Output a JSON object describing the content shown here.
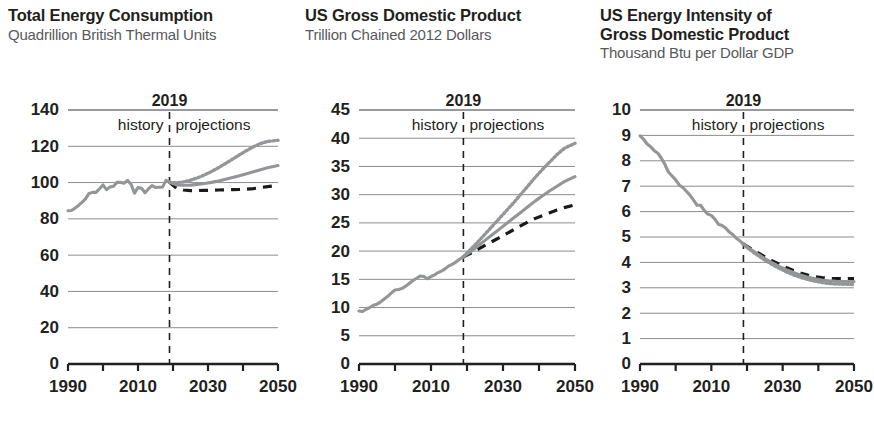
{
  "figure": {
    "background": "#ffffff",
    "colors": {
      "reference_line": "#939598",
      "high_line": "#939598",
      "low_line": "#1a1a1a",
      "text": "#231f20",
      "subtitle": "#58595b",
      "gridline": "#8c8c8c"
    }
  },
  "panels": [
    {
      "id": "total-energy-consumption",
      "title": "Total Energy Consumption",
      "subtitle": "Quadrillion British Thermal Units"
    },
    {
      "id": "us-gross-domestic-product",
      "title": "US Gross Domestic Product",
      "subtitle": "Trillion Chained 2012 Dollars"
    },
    {
      "id": "us-energy-intensity-of-gdp",
      "title": "US Energy Intensity of\nGross Domestic Product",
      "subtitle": "Thousand Btu per Dollar GDP"
    }
  ],
  "marker": {
    "year": "2019",
    "history_label": "history",
    "projections_label": "projections",
    "value": 2019
  },
  "chart_data": [
    {
      "type": "line",
      "title": "Total Energy Consumption",
      "subtitle": "Quadrillion British Thermal Units",
      "xlabel": "",
      "ylabel": "Quadrillion British Thermal Units",
      "xlim": [
        1990,
        2050
      ],
      "ylim": [
        0,
        140
      ],
      "yticks": [
        0,
        20,
        40,
        60,
        80,
        100,
        120,
        140
      ],
      "xticks": [
        1990,
        2000,
        2010,
        2020,
        2030,
        2040,
        2050
      ],
      "xtick_labels": [
        "1990",
        "",
        "2010",
        "",
        "2030",
        "",
        "2050"
      ],
      "grid": true,
      "legend": "none",
      "divider_year": 2019,
      "series": [
        {
          "name": "history",
          "style": "solid-gray",
          "x": [
            1990,
            1991,
            1992,
            1993,
            1994,
            1995,
            1996,
            1997,
            1998,
            1999,
            2000,
            2001,
            2002,
            2003,
            2004,
            2005,
            2006,
            2007,
            2008,
            2009,
            2010,
            2011,
            2012,
            2013,
            2014,
            2015,
            2016,
            2017,
            2018,
            2019
          ],
          "values": [
            84.5,
            84.6,
            85.9,
            87.4,
            89.1,
            91.0,
            94.0,
            94.6,
            94.6,
            96.6,
            98.7,
            96.1,
            97.6,
            98.0,
            100.1,
            100.2,
            99.6,
            101.2,
            99.1,
            94.2,
            97.3,
            96.9,
            94.4,
            96.5,
            98.3,
            97.3,
            97.4,
            97.5,
            101.2,
            100.2
          ]
        },
        {
          "name": "Reference case",
          "style": "solid-gray",
          "x": [
            2019,
            2021,
            2023,
            2025,
            2027,
            2029,
            2031,
            2033,
            2035,
            2037,
            2039,
            2041,
            2043,
            2045,
            2047,
            2050
          ],
          "values": [
            100.2,
            98.7,
            98.5,
            98.6,
            99.0,
            99.5,
            100.1,
            100.9,
            101.8,
            102.8,
            103.8,
            104.9,
            106.0,
            107.1,
            108.2,
            109.4
          ]
        },
        {
          "name": "High economic growth",
          "style": "dotted-gray",
          "x": [
            2019,
            2021,
            2023,
            2025,
            2027,
            2029,
            2031,
            2033,
            2035,
            2037,
            2039,
            2041,
            2043,
            2045,
            2047,
            2050
          ],
          "values": [
            100.2,
            99.8,
            100.4,
            101.3,
            102.6,
            104.2,
            106.1,
            108.2,
            110.5,
            112.9,
            115.3,
            117.6,
            119.7,
            121.5,
            122.7,
            123.3
          ]
        },
        {
          "name": "Low economic growth",
          "style": "dashed-black",
          "x": [
            2019,
            2021,
            2023,
            2025,
            2027,
            2029,
            2031,
            2033,
            2035,
            2037,
            2039,
            2041,
            2043,
            2045,
            2047,
            2050
          ],
          "values": [
            100.2,
            96.9,
            95.9,
            95.6,
            95.6,
            95.7,
            95.8,
            95.9,
            96.0,
            96.1,
            96.2,
            96.4,
            96.7,
            97.2,
            97.8,
            98.4
          ]
        }
      ]
    },
    {
      "type": "line",
      "title": "US Gross Domestic Product",
      "subtitle": "Trillion Chained 2012 Dollars",
      "xlabel": "",
      "ylabel": "Trillion Chained 2012 Dollars",
      "xlim": [
        1990,
        2050
      ],
      "ylim": [
        0,
        45
      ],
      "yticks": [
        0,
        5,
        10,
        15,
        20,
        25,
        30,
        35,
        40,
        45
      ],
      "xticks": [
        1990,
        2000,
        2010,
        2020,
        2030,
        2040,
        2050
      ],
      "xtick_labels": [
        "1990",
        "",
        "2010",
        "",
        "2030",
        "",
        "2050"
      ],
      "grid": true,
      "legend": "none",
      "divider_year": 2019,
      "series": [
        {
          "name": "history",
          "style": "solid-gray",
          "x": [
            1990,
            1991,
            1992,
            1993,
            1994,
            1995,
            1996,
            1997,
            1998,
            1999,
            2000,
            2001,
            2002,
            2003,
            2004,
            2005,
            2006,
            2007,
            2008,
            2009,
            2010,
            2011,
            2012,
            2013,
            2014,
            2015,
            2016,
            2017,
            2018,
            2019
          ],
          "values": [
            9.4,
            9.3,
            9.7,
            10.0,
            10.4,
            10.6,
            11.0,
            11.5,
            12.0,
            12.6,
            13.1,
            13.2,
            13.4,
            13.8,
            14.3,
            14.8,
            15.2,
            15.6,
            15.5,
            15.1,
            15.5,
            15.8,
            16.2,
            16.5,
            16.9,
            17.4,
            17.7,
            18.1,
            18.6,
            19.0
          ]
        },
        {
          "name": "Reference case",
          "style": "solid-gray",
          "x": [
            2019,
            2021,
            2023,
            2025,
            2027,
            2029,
            2031,
            2033,
            2035,
            2037,
            2039,
            2041,
            2043,
            2045,
            2047,
            2050
          ],
          "values": [
            19.0,
            19.9,
            20.9,
            21.9,
            22.9,
            23.9,
            24.9,
            25.9,
            26.9,
            27.9,
            28.9,
            29.8,
            30.7,
            31.5,
            32.3,
            33.2
          ]
        },
        {
          "name": "High economic growth",
          "style": "dotted-gray",
          "x": [
            2019,
            2021,
            2023,
            2025,
            2027,
            2029,
            2031,
            2033,
            2035,
            2037,
            2039,
            2041,
            2043,
            2045,
            2047,
            2050
          ],
          "values": [
            19.0,
            20.3,
            21.6,
            23.0,
            24.4,
            25.8,
            27.2,
            28.6,
            30.1,
            31.6,
            33.1,
            34.5,
            35.8,
            37.1,
            38.2,
            39.1
          ]
        },
        {
          "name": "Low economic growth",
          "style": "dashed-black",
          "x": [
            2019,
            2021,
            2023,
            2025,
            2027,
            2029,
            2031,
            2033,
            2035,
            2037,
            2039,
            2041,
            2043,
            2045,
            2047,
            2050
          ],
          "values": [
            19.0,
            19.6,
            20.3,
            21.0,
            21.7,
            22.4,
            23.1,
            23.8,
            24.5,
            25.2,
            25.8,
            26.3,
            26.8,
            27.3,
            27.7,
            28.2
          ]
        }
      ]
    },
    {
      "type": "line",
      "title": "US Energy Intensity of Gross Domestic Product",
      "subtitle": "Thousand Btu per Dollar GDP",
      "xlabel": "",
      "ylabel": "Thousand Btu per Dollar GDP",
      "xlim": [
        1990,
        2050
      ],
      "ylim": [
        0,
        10
      ],
      "yticks": [
        0,
        1,
        2,
        3,
        4,
        5,
        6,
        7,
        8,
        9,
        10
      ],
      "xticks": [
        1990,
        2000,
        2010,
        2020,
        2030,
        2040,
        2050
      ],
      "xtick_labels": [
        "1990",
        "",
        "2010",
        "",
        "2030",
        "",
        "2050"
      ],
      "grid": true,
      "legend": "none",
      "divider_year": 2019,
      "series": [
        {
          "name": "history",
          "style": "solid-gray",
          "x": [
            1990,
            1991,
            1992,
            1993,
            1994,
            1995,
            1996,
            1997,
            1998,
            1999,
            2000,
            2001,
            2002,
            2003,
            2004,
            2005,
            2006,
            2007,
            2008,
            2009,
            2010,
            2011,
            2012,
            2013,
            2014,
            2015,
            2016,
            2017,
            2018,
            2019
          ],
          "values": [
            8.98,
            8.85,
            8.66,
            8.55,
            8.4,
            8.3,
            8.1,
            7.85,
            7.55,
            7.4,
            7.25,
            7.05,
            6.95,
            6.8,
            6.65,
            6.45,
            6.25,
            6.25,
            6.05,
            5.9,
            5.85,
            5.7,
            5.5,
            5.45,
            5.35,
            5.2,
            5.1,
            4.95,
            4.85,
            4.72
          ]
        },
        {
          "name": "Reference case",
          "style": "solid-gray",
          "x": [
            2019,
            2021,
            2023,
            2025,
            2027,
            2029,
            2031,
            2033,
            2035,
            2037,
            2039,
            2041,
            2043,
            2045,
            2047,
            2050
          ],
          "values": [
            4.72,
            4.52,
            4.33,
            4.15,
            3.99,
            3.84,
            3.71,
            3.6,
            3.5,
            3.42,
            3.36,
            3.31,
            3.28,
            3.26,
            3.25,
            3.25
          ]
        },
        {
          "name": "High economic growth",
          "style": "dotted-gray",
          "x": [
            2019,
            2021,
            2023,
            2025,
            2027,
            2029,
            2031,
            2033,
            2035,
            2037,
            2039,
            2041,
            2043,
            2045,
            2047,
            2050
          ],
          "values": [
            4.72,
            4.48,
            4.28,
            4.09,
            3.92,
            3.77,
            3.63,
            3.51,
            3.41,
            3.33,
            3.26,
            3.21,
            3.17,
            3.15,
            3.14,
            3.13
          ]
        },
        {
          "name": "Low economic growth",
          "style": "dashed-black",
          "x": [
            2019,
            2021,
            2023,
            2025,
            2027,
            2029,
            2031,
            2033,
            2035,
            2037,
            2039,
            2041,
            2043,
            2045,
            2047,
            2050
          ],
          "values": [
            4.72,
            4.55,
            4.38,
            4.22,
            4.07,
            3.93,
            3.8,
            3.68,
            3.58,
            3.5,
            3.44,
            3.4,
            3.37,
            3.36,
            3.36,
            3.36
          ]
        }
      ]
    }
  ]
}
